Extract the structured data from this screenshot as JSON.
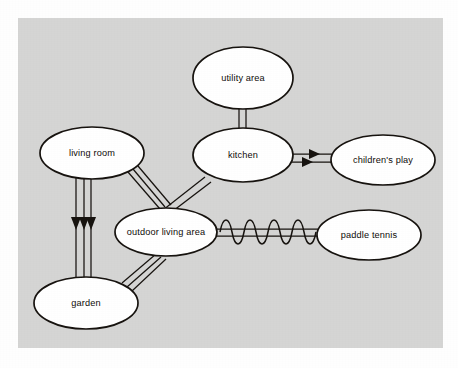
{
  "diagram": {
    "panel_color": "#d5d5d4",
    "background_color": "#fefefe",
    "node_fill": "#ffffff",
    "node_stroke": "#17130f",
    "nodes": [
      {
        "id": "utility-area",
        "label": "utility area",
        "cx": 243,
        "cy": 78,
        "rx": 50,
        "ry": 31
      },
      {
        "id": "living-room",
        "label": "living room",
        "cx": 92,
        "cy": 153,
        "rx": 52,
        "ry": 26
      },
      {
        "id": "kitchen",
        "label": "kitchen",
        "cx": 243,
        "cy": 155,
        "rx": 50,
        "ry": 27
      },
      {
        "id": "childrens-play",
        "label": "children's play",
        "cx": 383,
        "cy": 160,
        "rx": 52,
        "ry": 25
      },
      {
        "id": "outdoor-living-area",
        "label": "outdoor living area",
        "cx": 166,
        "cy": 232,
        "rx": 51,
        "ry": 24
      },
      {
        "id": "paddle-tennis",
        "label": "paddle tennis",
        "cx": 369,
        "cy": 235,
        "rx": 52,
        "ry": 25
      },
      {
        "id": "garden",
        "label": "garden",
        "cx": 86,
        "cy": 303,
        "rx": 52,
        "ry": 26
      }
    ],
    "edges": [
      {
        "id": "utility-to-kitchen",
        "from": "utility-area",
        "to": "kitchen",
        "style": "double-line",
        "arrows": "none"
      },
      {
        "id": "kitchen-to-play",
        "from": "kitchen",
        "to": "childrens-play",
        "style": "double-line",
        "arrows": "two-right"
      },
      {
        "id": "kitchen-to-outdoor",
        "from": "kitchen",
        "to": "outdoor-living-area",
        "style": "double-line",
        "arrows": "none"
      },
      {
        "id": "living-room-to-outdoor",
        "from": "living-room",
        "to": "outdoor-living-area",
        "style": "triple-line",
        "arrows": "none"
      },
      {
        "id": "living-room-to-garden",
        "from": "living-room",
        "to": "garden",
        "style": "triple-line",
        "arrows": "three-down"
      },
      {
        "id": "garden-to-outdoor",
        "from": "garden",
        "to": "outdoor-living-area",
        "style": "triple-line",
        "arrows": "none"
      },
      {
        "id": "outdoor-to-paddle-tennis",
        "from": "outdoor-living-area",
        "to": "paddle-tennis",
        "style": "double-line-wavy",
        "arrows": "none",
        "wave_cycles": 4
      }
    ]
  }
}
